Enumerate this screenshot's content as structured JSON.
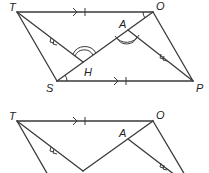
{
  "diagram_top": {
    "vertices": [
      {
        "label": "T",
        "x": 17,
        "y": 12,
        "lx": 4,
        "ly": 10
      },
      {
        "label": "O",
        "x": 153,
        "y": 12,
        "lx": 156,
        "ly": 10
      },
      {
        "label": "S",
        "x": 57,
        "y": 81,
        "lx": 44,
        "ly": 92
      },
      {
        "label": "P",
        "x": 193,
        "y": 81,
        "lx": 197,
        "ly": 92
      },
      {
        "label": "A",
        "x": 128,
        "y": 30,
        "lx": 119,
        "ly": 28
      },
      {
        "label": "H",
        "x": 83,
        "y": 62,
        "lx": 84,
        "ly": 76
      }
    ],
    "segments": [
      "TO",
      "SP",
      "TS",
      "OP",
      "SO",
      "TH",
      "AP"
    ],
    "marks": {
      "TO": "arrow + single tick",
      "SP": "arrow + single tick",
      "TH": "double arrow",
      "AP": "double arrow",
      "angle_THA": "double arc",
      "angle_HAP": "double arc",
      "angle_TOS": "single arc",
      "angle_OSP": "single arc"
    }
  },
  "diagram_bottom": {
    "vertices": [
      {
        "label": "T",
        "x": 17,
        "y": 121,
        "lx": 4,
        "ly": 118
      },
      {
        "label": "O",
        "x": 153,
        "y": 121,
        "lx": 156,
        "ly": 118
      },
      {
        "label": "A",
        "x": 128,
        "y": 139,
        "lx": 118,
        "ly": 137
      }
    ],
    "marks": {
      "TO": "arrow + single tick",
      "TH": "double arrow",
      "AP": "double arrow"
    }
  }
}
